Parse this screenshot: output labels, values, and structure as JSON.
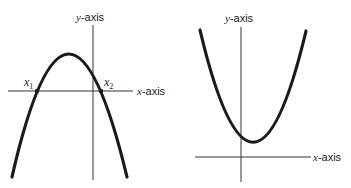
{
  "figures": [
    {
      "name": "downward-parabola",
      "y_axis_label": {
        "var": "y",
        "rest": "-axis"
      },
      "x_axis_label": {
        "var": "x",
        "rest": "-axis"
      },
      "roots": [
        {
          "var": "x",
          "sub": "1"
        },
        {
          "var": "x",
          "sub": "2"
        }
      ]
    },
    {
      "name": "upward-parabola",
      "y_axis_label": {
        "var": "y",
        "rest": "-axis"
      },
      "x_axis_label": {
        "var": "x",
        "rest": "-axis"
      }
    }
  ],
  "colors": {
    "curve": "#1a1a1a",
    "axis": "#333333",
    "background": "#ffffff"
  }
}
